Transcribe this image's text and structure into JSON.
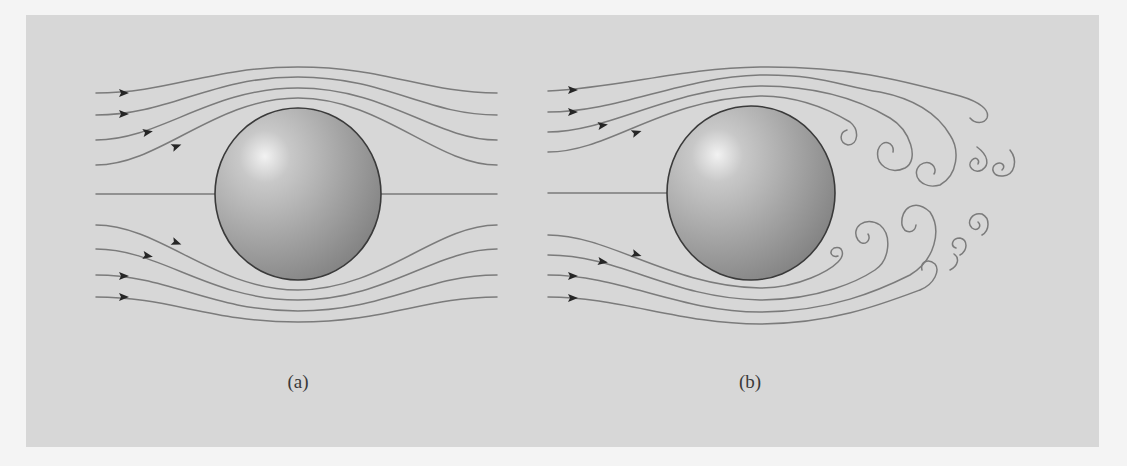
{
  "figure": {
    "colors": {
      "outer_background": "#f4f4f4",
      "panel_background": "#d7d7d7",
      "streamline": "#7b7b7b",
      "arrowhead": "#262626",
      "sphere_highlight": "#f2f2f2",
      "sphere_mid": "#a9a9a9",
      "sphere_shadow": "#7e7e7e",
      "sphere_outline": "#3a3a3a"
    },
    "panels": [
      {
        "id": "a",
        "caption": "(a)",
        "flow_type": "laminar",
        "streamline_count": 9,
        "arrow_count": 8,
        "sphere": {
          "cx": 298,
          "cy": 194,
          "rx": 83,
          "ry": 86
        }
      },
      {
        "id": "b",
        "caption": "(b)",
        "flow_type": "turbulent wake",
        "streamline_count": 9,
        "arrow_count": 8,
        "vortex_count": 12,
        "sphere": {
          "cx": 751,
          "cy": 193,
          "rx": 84,
          "ry": 87
        }
      }
    ]
  }
}
